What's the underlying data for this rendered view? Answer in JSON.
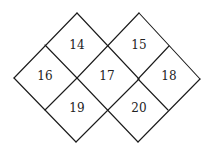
{
  "diagram": {
    "type": "diamond-grid",
    "line_color": "#1a1a1a",
    "cells": [
      {
        "id": "cell-14",
        "label": "14",
        "x": 77,
        "y": 45
      },
      {
        "id": "cell-15",
        "label": "15",
        "x": 139,
        "y": 45
      },
      {
        "id": "cell-16",
        "label": "16",
        "x": 45,
        "y": 76
      },
      {
        "id": "cell-17",
        "label": "17",
        "x": 107,
        "y": 76
      },
      {
        "id": "cell-18",
        "label": "18",
        "x": 169,
        "y": 76
      },
      {
        "id": "cell-19",
        "label": "19",
        "x": 77,
        "y": 108
      },
      {
        "id": "cell-20",
        "label": "20",
        "x": 139,
        "y": 108
      }
    ]
  }
}
